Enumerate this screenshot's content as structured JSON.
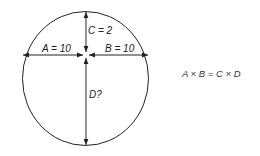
{
  "diagram": {
    "labels": {
      "a": "A = 10",
      "b": "B = 10",
      "c": "C = 2",
      "d": "D?"
    },
    "equation": "A × B = C × D",
    "stroke_color": "#222222"
  }
}
